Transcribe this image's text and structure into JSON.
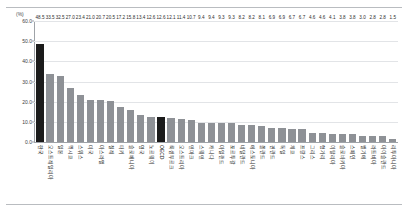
{
  "chart_data": {
    "type": "bar",
    "title": "",
    "xlabel": "",
    "ylabel": "",
    "unit_label": "(%)",
    "ylim": [
      0,
      60
    ],
    "yticks": [
      "0.0",
      "10.0",
      "20.0",
      "30.0",
      "40.0",
      "50.0",
      "60.0"
    ],
    "ytick_values": [
      0,
      10,
      20,
      30,
      40,
      50,
      60
    ],
    "grid": true,
    "legend": "none",
    "highlight_color": "#1b1b1b",
    "bar_color": "#8e9196",
    "highlighted_categories": [
      "한국",
      "OECD"
    ],
    "categories": [
      "한국",
      "오스트레일리아",
      "일본",
      "멕시코",
      "스위스",
      "미국",
      "아스라엘",
      "칠레",
      "터키",
      "슬로베니아",
      "영국",
      "노르웨이",
      "OECD",
      "룩셈부르크",
      "오스트리아",
      "덴마크",
      "스웨덴",
      "캐나다",
      "아일랜드",
      "포르투갈",
      "네덜란드",
      "에스토니아",
      "폴란드",
      "핀란드",
      "독일",
      "체코",
      "프랑스",
      "그리스",
      "헝가리",
      "이탈리아",
      "슬로바키아",
      "스페인",
      "벨기에",
      "라트비아",
      "아이슬란드",
      "리투아니아"
    ],
    "values": [
      48.5,
      33.5,
      32.5,
      27.0,
      23.4,
      21.0,
      20.7,
      20.5,
      17.2,
      15.8,
      13.4,
      12.6,
      12.6,
      12.1,
      11.4,
      10.7,
      9.4,
      9.4,
      9.3,
      9.3,
      8.2,
      8.2,
      8.1,
      6.9,
      6.9,
      6.7,
      6.7,
      4.6,
      4.6,
      4.1,
      3.8,
      3.8,
      3.0,
      2.8,
      2.8,
      1.5
    ],
    "value_labels": [
      "48.5",
      "33.5",
      "32.5",
      "27.0",
      "23.4",
      "21.0",
      "20.7",
      "20.5",
      "17.2",
      "15.8",
      "13.4",
      "12.6",
      "12.6",
      "12.1",
      "11.4",
      "10.7",
      "9.4",
      "9.4",
      "9.3",
      "9.3",
      "8.2",
      "8.2",
      "8.1",
      "6.9",
      "6.9",
      "6.7",
      "6.7",
      "4.6",
      "4.6",
      "4.1",
      "3.8",
      "3.8",
      "3.0",
      "2.8",
      "2.8",
      "1.5"
    ]
  }
}
